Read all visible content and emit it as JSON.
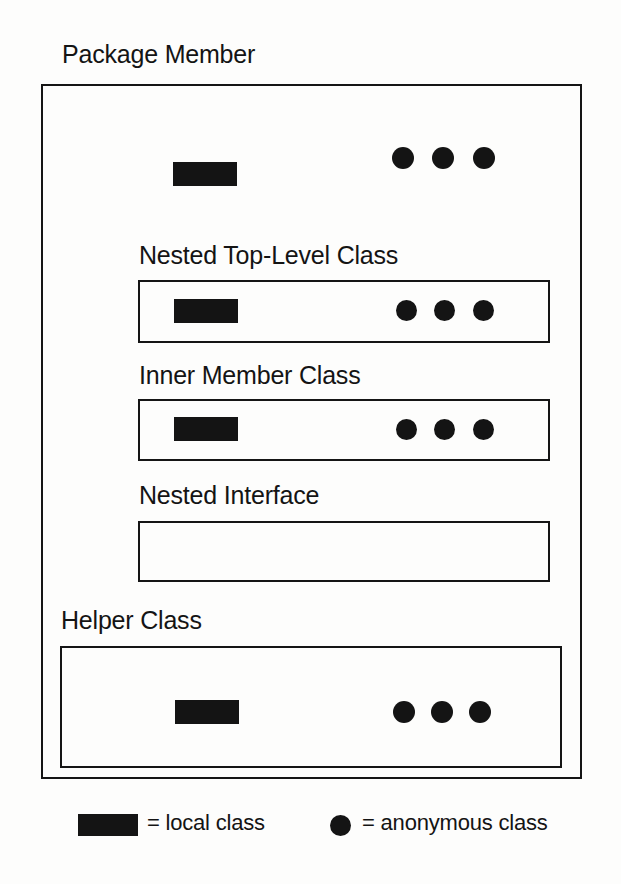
{
  "diagram": {
    "title": "Package Member",
    "colors": {
      "ink": "#141414",
      "background": "#fdfdfc",
      "stroke": "#151515"
    },
    "sections": [
      {
        "name": "package-member",
        "label": "Package Member",
        "local_classes": 1,
        "anonymous_classes": 3
      },
      {
        "name": "nested-top-level-class",
        "label": "Nested Top-Level Class",
        "local_classes": 1,
        "anonymous_classes": 3
      },
      {
        "name": "inner-member-class",
        "label": "Inner Member Class",
        "local_classes": 1,
        "anonymous_classes": 3
      },
      {
        "name": "nested-interface",
        "label": "Nested Interface",
        "local_classes": 0,
        "anonymous_classes": 0
      },
      {
        "name": "helper-class",
        "label": "Helper Class",
        "local_classes": 1,
        "anonymous_classes": 3
      }
    ]
  },
  "legend": {
    "local": {
      "marker": "filled-rectangle",
      "text": "= local class"
    },
    "anonymous": {
      "marker": "filled-circle",
      "text": "= anonymous class"
    }
  }
}
